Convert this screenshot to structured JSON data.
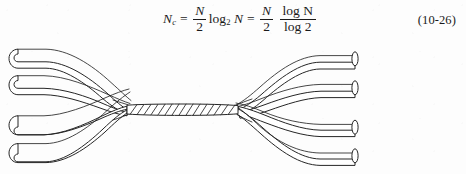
{
  "page": {
    "background_color": "#fdfdfd",
    "ink_color": "#262626"
  },
  "equation": {
    "label": "N_c = (N/2) log_2 N = (N/2) (log N / log 2)",
    "lhs_symbol": "N",
    "lhs_subscript": "c",
    "equals_1": "=",
    "first_fraction": {
      "numerator": "N",
      "denominator": "2"
    },
    "log_base2_text": "log",
    "log_base2_subscript": "2",
    "log_argument": "N",
    "equals_2": "=",
    "second_fraction": {
      "numerator": "N",
      "denominator": "2"
    },
    "ratio_fraction": {
      "numerator": "log N",
      "denominator": "log 2"
    },
    "number": "(10-26)"
  },
  "figure": {
    "caption": "",
    "left_wire_count": 4,
    "right_wire_count": 4,
    "braid_label": "twisted cable core",
    "left_ends": [
      "left-wire-end-1",
      "left-wire-end-2",
      "left-wire-end-3",
      "left-wire-end-4"
    ],
    "right_ends": [
      "right-wire-end-1",
      "right-wire-end-2",
      "right-wire-end-3",
      "right-wire-end-4"
    ]
  }
}
